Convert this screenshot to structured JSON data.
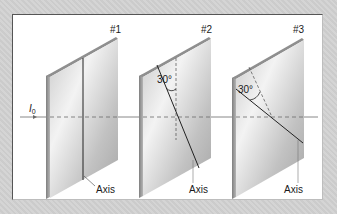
{
  "figure": {
    "incident_intensity_label": "I",
    "incident_intensity_subscript": "0",
    "polarizers": [
      {
        "id": "#1",
        "label": "#1",
        "axis_label": "Axis",
        "axis_angle_from_vertical_deg": 0,
        "angle_label": ""
      },
      {
        "id": "#2",
        "label": "#2",
        "axis_label": "Axis",
        "axis_angle_from_vertical_deg": 30,
        "angle_label": "30°"
      },
      {
        "id": "#3",
        "label": "#3",
        "axis_label": "Axis",
        "axis_angle_from_previous_axis_deg": 30,
        "angle_label": "30°"
      }
    ]
  },
  "colors": {
    "background": "#d2d2d2",
    "panel": "#ffffff",
    "plate_face_light": "#f2f2f2",
    "plate_face_dark": "#a9a9a9",
    "plate_edge": "#8c8c8c",
    "line": "#222222",
    "beam": "#6a6a6a"
  }
}
